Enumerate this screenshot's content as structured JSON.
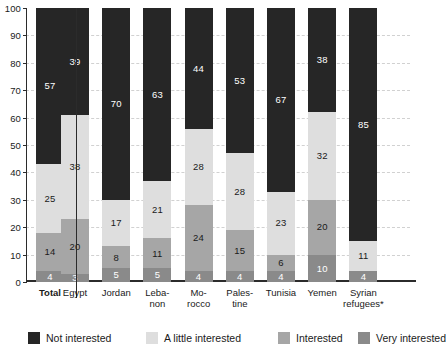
{
  "chart_data": {
    "type": "bar",
    "subtype": "stacked-bar-100",
    "title": "",
    "xlabel": "",
    "ylabel": "",
    "ylim": [
      0,
      100
    ],
    "ytick_step": 10,
    "yticks": [
      0,
      10,
      20,
      30,
      40,
      50,
      60,
      70,
      80,
      90,
      100
    ],
    "grid": true,
    "legend_position": "bottom",
    "categories": [
      "Total",
      "Egypt",
      "Jordan",
      "Lebanon",
      "Morocco",
      "Palestine",
      "Tunisia",
      "Yemen",
      "Syrian refugees*"
    ],
    "category_lines": [
      [
        "Total"
      ],
      [
        "Egypt"
      ],
      [
        "Jordan"
      ],
      [
        "Leba-",
        "non"
      ],
      [
        "Mo-",
        "rocco"
      ],
      [
        "Pales-",
        "tine"
      ],
      [
        "Tunisia"
      ],
      [
        "Yemen"
      ],
      [
        "Syrian",
        "refugees*"
      ]
    ],
    "series": [
      {
        "name": "Very interested",
        "color": "#8a8a8a",
        "values": [
          4,
          3,
          5,
          5,
          4,
          4,
          4,
          10,
          4
        ]
      },
      {
        "name": "Interested",
        "color": "#a6a6a6",
        "values": [
          14,
          20,
          8,
          11,
          24,
          15,
          6,
          20,
          0
        ]
      },
      {
        "name": "A little interested",
        "color": "#dedede",
        "values": [
          25,
          38,
          17,
          21,
          28,
          28,
          23,
          32,
          11
        ]
      },
      {
        "name": "Not interested",
        "color": "#262626",
        "values": [
          57,
          39,
          70,
          63,
          44,
          53,
          67,
          38,
          85
        ]
      }
    ],
    "stack_order_bottom_to_top": [
      "Very interested",
      "Interested",
      "A little interested",
      "Not interested"
    ],
    "legend": [
      {
        "label": "Not interested",
        "color": "#262626"
      },
      {
        "label": "A little interested",
        "color": "#dedede"
      },
      {
        "label": "Interested",
        "color": "#a6a6a6"
      },
      {
        "label": "Very interested",
        "color": "#8a8a8a"
      }
    ],
    "value_label_colors": {
      "Not interested": "#ffffff",
      "A little interested": "#1a1a1a",
      "Interested": "#1a1a1a",
      "Very interested": "#ffffff"
    }
  }
}
